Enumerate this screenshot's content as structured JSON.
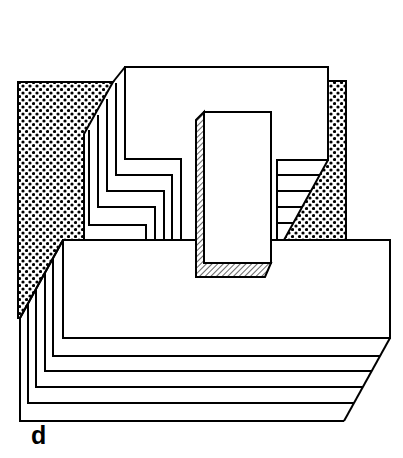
{
  "figure": {
    "label": "d",
    "colors": {
      "stroke": "#000000",
      "background": "#ffffff"
    }
  }
}
